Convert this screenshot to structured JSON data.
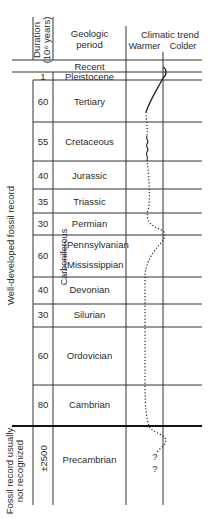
{
  "header": {
    "duration_label": "Duration",
    "duration_unit": "(10⁶ years)",
    "period_label_line1": "Geologic",
    "period_label_line2": "period",
    "trend_label": "Climatic trend",
    "warmer_label": "Warmer",
    "colder_label": "Colder"
  },
  "side_labels": {
    "well_developed": "Well-developed fossil record",
    "not_recognized_line1": "Fossil record usually",
    "not_recognized_line2": "not recognized"
  },
  "carboniferous_label": "Carboniferous",
  "periods": [
    {
      "name": "Recent",
      "duration": ""
    },
    {
      "name": "Pleistocene",
      "duration": "1"
    },
    {
      "name": "Tertiary",
      "duration": "60"
    },
    {
      "name": "Cretaceous",
      "duration": "55"
    },
    {
      "name": "Jurassic",
      "duration": "40"
    },
    {
      "name": "Triassic",
      "duration": "35"
    },
    {
      "name": "Permian",
      "duration": "30"
    },
    {
      "name": "Pennsylvanian",
      "duration": "60"
    },
    {
      "name": "Mississippian",
      "duration": ""
    },
    {
      "name": "Devonian",
      "duration": "40"
    },
    {
      "name": "Silurian",
      "duration": "30"
    },
    {
      "name": "Ordovician",
      "duration": "60"
    },
    {
      "name": "Cambrian",
      "duration": "80"
    },
    {
      "name": "Precambrian",
      "duration": "±2500"
    }
  ],
  "uncertainty_marks": [
    "?",
    "?"
  ]
}
